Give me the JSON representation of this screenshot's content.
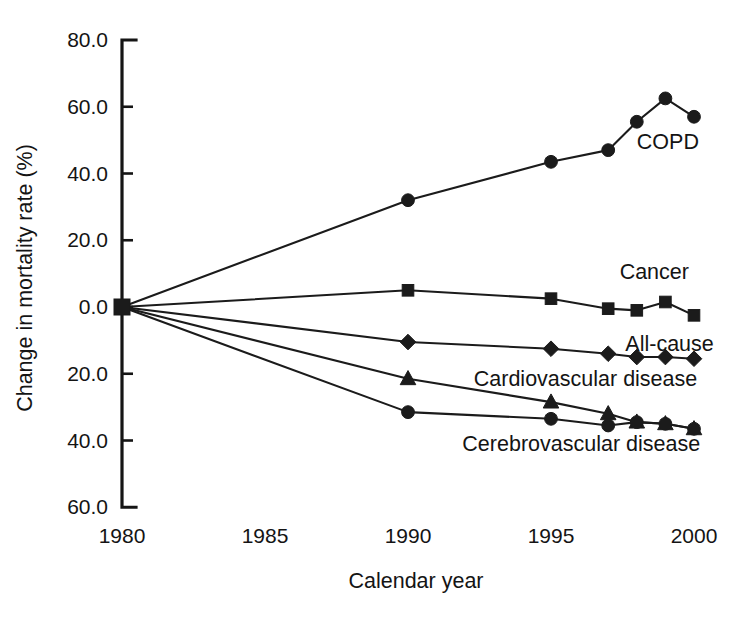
{
  "chart_data": {
    "type": "line",
    "title": "",
    "subtitle": "",
    "xlabel": "Calendar year",
    "ylabel": "Change in mortality rate (%)",
    "xlim": [
      1979,
      2001
    ],
    "ylim": [
      -60,
      80
    ],
    "xticks": [
      1980,
      1985,
      1990,
      1995,
      2000
    ],
    "xtick_labels": [
      "1980",
      "1985",
      "1990",
      "1995",
      "2000"
    ],
    "yticks": [
      80,
      60,
      40,
      20,
      0,
      -20,
      -40,
      -60
    ],
    "ytick_labels": [
      "80.0",
      "60.0",
      "40.0",
      "20.0",
      "0.0",
      "20.0",
      "40.0",
      "60.0"
    ],
    "grid": false,
    "legend_position": "inline-labels",
    "note_on_ytick_labels": "Negative values are printed without a minus sign on the axis",
    "series": [
      {
        "name": "COPD",
        "label": "COPD",
        "marker": "circle",
        "label_x": 1998.0,
        "label_y": 49.5,
        "x": [
          1980,
          1990,
          1995,
          1997,
          1998,
          1999,
          2000
        ],
        "y": [
          0.0,
          32.0,
          43.5,
          47.0,
          55.5,
          62.5,
          57.0
        ]
      },
      {
        "name": "Cancer",
        "label": "Cancer",
        "marker": "square",
        "label_x": 1997.4,
        "label_y": 10.5,
        "x": [
          1980,
          1990,
          1995,
          1997,
          1998,
          1999,
          2000
        ],
        "y": [
          0.0,
          5.0,
          2.5,
          -0.5,
          -1.0,
          1.5,
          -2.5
        ]
      },
      {
        "name": "All-cause",
        "label": "All-cause",
        "marker": "diamond",
        "label_x": 1997.6,
        "label_y": -11.0,
        "x": [
          1980,
          1990,
          1995,
          1997,
          1998,
          1999,
          2000
        ],
        "y": [
          0.0,
          -10.5,
          -12.5,
          -14.0,
          -15.0,
          -15.0,
          -15.5
        ]
      },
      {
        "name": "Cardiovascular disease",
        "label": "Cardiovascular disease",
        "marker": "triangle",
        "label_x": 1992.3,
        "label_y": -21.5,
        "x": [
          1980,
          1990,
          1995,
          1997,
          1998,
          1999,
          2000
        ],
        "y": [
          0.0,
          -21.5,
          -28.5,
          -32.0,
          -34.5,
          -35.0,
          -36.5
        ]
      },
      {
        "name": "Cerebrovascular disease",
        "label": "Cerebrovascular disease",
        "marker": "circle",
        "label_x": 1991.9,
        "label_y": -41.0,
        "x": [
          1980,
          1990,
          1995,
          1997,
          1998,
          1999,
          2000
        ],
        "y": [
          0.0,
          -31.5,
          -33.5,
          -35.5,
          -34.5,
          -35.0,
          -36.5
        ]
      }
    ],
    "origin_marker": {
      "name": "origin-square-marker",
      "marker": "square",
      "x": 1980,
      "y": 0.0
    }
  }
}
